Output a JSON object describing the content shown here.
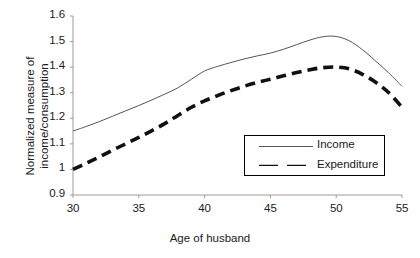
{
  "chart_data": {
    "type": "line",
    "title": "",
    "xlabel": "Age of husband",
    "ylabel": "Normalized measure of income/consumption",
    "ylabel_line1": "Normalized measure of",
    "ylabel_line2": "income/consumption",
    "xlim": [
      30,
      55
    ],
    "ylim": [
      0.9,
      1.6
    ],
    "grid": false,
    "legend_position": "inside-bottom-right",
    "x_ticks": [
      30,
      35,
      40,
      45,
      50,
      55
    ],
    "x_tick_labels": [
      "30",
      "35",
      "40",
      "45",
      "50",
      "55"
    ],
    "y_ticks": [
      0.9,
      1.0,
      1.1,
      1.2,
      1.3,
      1.4,
      1.5,
      1.6
    ],
    "y_tick_labels": [
      "0.9",
      "1",
      "1.1",
      "1.2",
      "1.3",
      "1.4",
      "1.5",
      "1.6"
    ],
    "x": [
      30,
      31,
      32,
      33,
      34,
      35,
      36,
      37,
      38,
      39,
      40,
      41,
      42,
      43,
      44,
      45,
      46,
      47,
      48,
      49,
      50,
      51,
      52,
      53,
      54,
      55
    ],
    "series": [
      {
        "name": "Income",
        "style": "solid-thin",
        "color": "#555555",
        "values": [
          1.15,
          1.168,
          1.187,
          1.208,
          1.229,
          1.25,
          1.272,
          1.295,
          1.32,
          1.353,
          1.385,
          1.403,
          1.418,
          1.432,
          1.444,
          1.455,
          1.47,
          1.488,
          1.506,
          1.519,
          1.52,
          1.503,
          1.468,
          1.424,
          1.377,
          1.325
        ]
      },
      {
        "name": "Expenditure",
        "style": "dashed-thick",
        "color": "#111111",
        "values": [
          1.0,
          1.024,
          1.049,
          1.075,
          1.1,
          1.125,
          1.152,
          1.18,
          1.212,
          1.243,
          1.268,
          1.289,
          1.308,
          1.325,
          1.34,
          1.353,
          1.366,
          1.379,
          1.39,
          1.398,
          1.4,
          1.393,
          1.372,
          1.341,
          1.3,
          1.243
        ]
      }
    ]
  },
  "legend": {
    "entries": [
      {
        "label": "Income"
      },
      {
        "label": "Expenditure"
      }
    ]
  },
  "colors": {
    "income_line": "#555555",
    "expenditure_line": "#111111",
    "axis": "#9a9a9a",
    "text": "#1a1a1a",
    "background": "#ffffff"
  }
}
